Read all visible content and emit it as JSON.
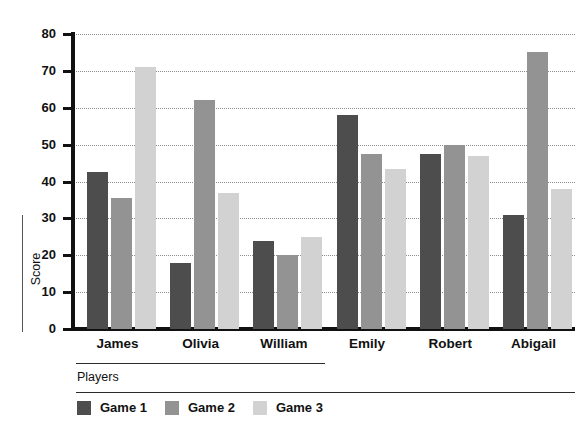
{
  "chart_data": {
    "type": "bar",
    "title": "",
    "xlabel": "Players",
    "ylabel": "Score",
    "categories": [
      "James",
      "Olivia",
      "William",
      "Emily",
      "Robert",
      "Abigail"
    ],
    "series": [
      {
        "name": "Game 1",
        "color": "#4d4d4d",
        "values": [
          42.5,
          18,
          24,
          58,
          47.5,
          31
        ]
      },
      {
        "name": "Game 2",
        "color": "#939393",
        "values": [
          35.5,
          62,
          20,
          47.5,
          50,
          75
        ]
      },
      {
        "name": "Game 3",
        "color": "#d2d2d2",
        "values": [
          71,
          37,
          25,
          43.5,
          47,
          38
        ]
      }
    ],
    "ylim": [
      0,
      80
    ],
    "yticks": [
      0,
      10,
      20,
      30,
      40,
      50,
      60,
      70,
      80
    ],
    "ytick_labels": [
      "0",
      "10",
      "20",
      "30",
      "40",
      "50",
      "60",
      "70",
      "80"
    ],
    "grid": true,
    "grid_axis": "y",
    "grid_style": "dotted",
    "legend_position": "bottom-left",
    "background_color": "#ffffff",
    "axis_color": "#111111"
  }
}
